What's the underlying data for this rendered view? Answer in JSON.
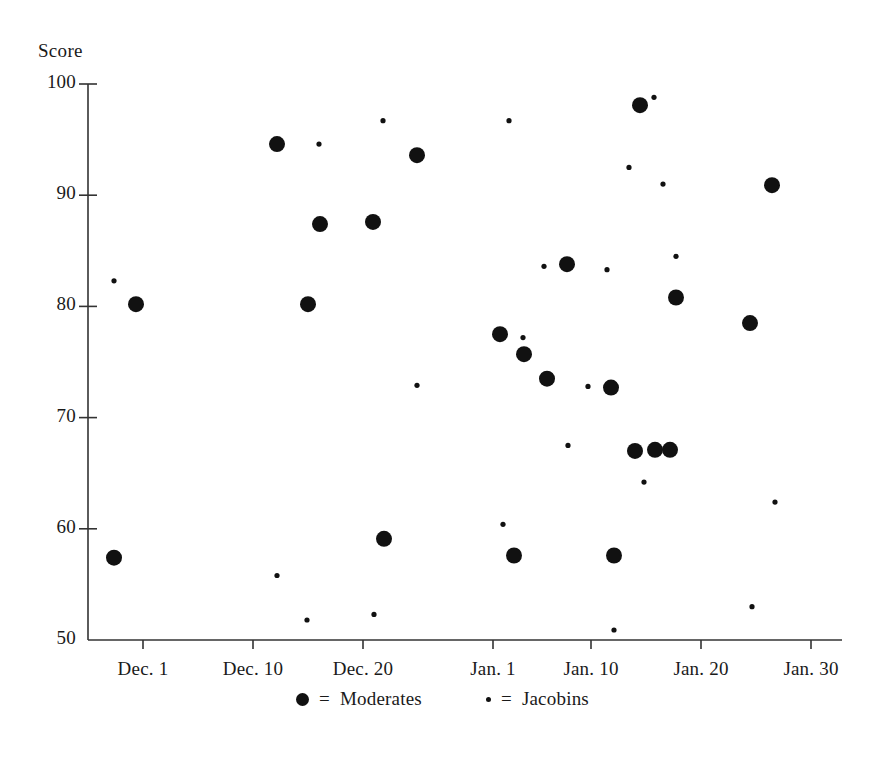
{
  "chart_data": {
    "type": "scatter",
    "title": "",
    "subtitle": "",
    "xlabel": "",
    "ylabel": "Score",
    "ylim": [
      50,
      100
    ],
    "yticks": [
      100,
      90,
      80,
      70,
      60,
      50
    ],
    "ytick_labels": [
      "100",
      "90",
      "80",
      "70",
      "60",
      "50"
    ],
    "xtick_labels": [
      "Dec. 1",
      "Dec. 10",
      "Dec. 20",
      "Jan. 1",
      "Jan. 10",
      "Jan. 20",
      "Jan. 30"
    ],
    "xtick_positions_px": [
      143,
      253,
      363,
      493,
      591,
      701,
      811
    ],
    "grid": false,
    "legend_position": "below-axis",
    "legend": [
      {
        "marker": "large-filled-circle",
        "label": "Moderates"
      },
      {
        "marker": "small-filled-dot",
        "label": "Jacobins"
      }
    ],
    "series": [
      {
        "name": "Moderates",
        "marker": "large-filled-circle",
        "color": "#111111",
        "points": [
          {
            "x_px": 114,
            "y_value": 57.4
          },
          {
            "x_px": 136,
            "y_value": 80.2
          },
          {
            "x_px": 277,
            "y_value": 94.6
          },
          {
            "x_px": 308,
            "y_value": 80.2
          },
          {
            "x_px": 320,
            "y_value": 87.4
          },
          {
            "x_px": 373,
            "y_value": 87.6
          },
          {
            "x_px": 384,
            "y_value": 59.1
          },
          {
            "x_px": 417,
            "y_value": 93.6
          },
          {
            "x_px": 500,
            "y_value": 77.5
          },
          {
            "x_px": 514,
            "y_value": 57.6
          },
          {
            "x_px": 524,
            "y_value": 75.7
          },
          {
            "x_px": 547,
            "y_value": 73.5
          },
          {
            "x_px": 567,
            "y_value": 83.8
          },
          {
            "x_px": 611,
            "y_value": 72.7
          },
          {
            "x_px": 614,
            "y_value": 57.6
          },
          {
            "x_px": 635,
            "y_value": 67.0
          },
          {
            "x_px": 655,
            "y_value": 67.1
          },
          {
            "x_px": 670,
            "y_value": 67.1
          },
          {
            "x_px": 640,
            "y_value": 98.1
          },
          {
            "x_px": 676,
            "y_value": 80.8
          },
          {
            "x_px": 750,
            "y_value": 78.5
          },
          {
            "x_px": 772,
            "y_value": 90.9
          }
        ]
      },
      {
        "name": "Jacobins",
        "marker": "small-filled-dot",
        "color": "#111111",
        "points": [
          {
            "x_px": 114,
            "y_value": 82.3
          },
          {
            "x_px": 277,
            "y_value": 55.8
          },
          {
            "x_px": 307,
            "y_value": 51.8
          },
          {
            "x_px": 319,
            "y_value": 94.6
          },
          {
            "x_px": 374,
            "y_value": 52.3
          },
          {
            "x_px": 383,
            "y_value": 96.7
          },
          {
            "x_px": 417,
            "y_value": 72.9
          },
          {
            "x_px": 503,
            "y_value": 60.4
          },
          {
            "x_px": 509,
            "y_value": 96.7
          },
          {
            "x_px": 523,
            "y_value": 77.2
          },
          {
            "x_px": 544,
            "y_value": 83.6
          },
          {
            "x_px": 568,
            "y_value": 67.5
          },
          {
            "x_px": 588,
            "y_value": 72.8
          },
          {
            "x_px": 607,
            "y_value": 83.3
          },
          {
            "x_px": 614,
            "y_value": 50.9
          },
          {
            "x_px": 629,
            "y_value": 92.5
          },
          {
            "x_px": 644,
            "y_value": 64.2
          },
          {
            "x_px": 654,
            "y_value": 98.8
          },
          {
            "x_px": 663,
            "y_value": 91.0
          },
          {
            "x_px": 676,
            "y_value": 84.5
          },
          {
            "x_px": 752,
            "y_value": 53.0
          },
          {
            "x_px": 775,
            "y_value": 62.4
          }
        ]
      }
    ]
  },
  "axes_geometry": {
    "x_axis_left_px": 88,
    "x_axis_right_px": 842,
    "y_top_value": 100,
    "y_top_px": 84,
    "y_bottom_value": 50,
    "y_bottom_px": 640,
    "tick_length_px": 9,
    "marker_radius_large_px": 8,
    "marker_radius_small_px": 2.6,
    "axis_color": "#333333",
    "marker_color": "#111111"
  }
}
